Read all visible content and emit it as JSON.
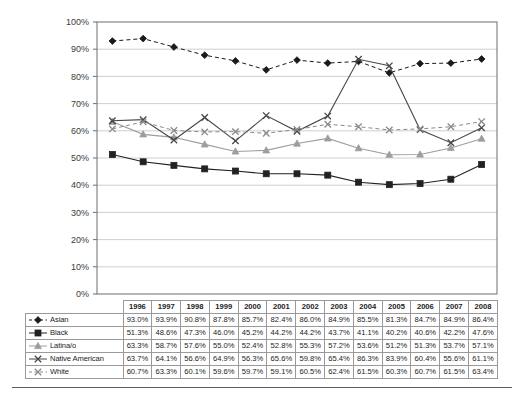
{
  "chart_data": {
    "type": "line",
    "title": "",
    "xlabel": "",
    "ylabel": "",
    "categories": [
      "1996",
      "1997",
      "1998",
      "1999",
      "2000",
      "2001",
      "2002",
      "2003",
      "2004",
      "2005",
      "2006",
      "2007",
      "2008"
    ],
    "ylim": [
      0,
      100
    ],
    "ytick_labels": [
      "0%",
      "10%",
      "20%",
      "30%",
      "40%",
      "50%",
      "60%",
      "70%",
      "80%",
      "90%",
      "100%"
    ],
    "ytick_values": [
      0,
      10,
      20,
      30,
      40,
      50,
      60,
      70,
      80,
      90,
      100
    ],
    "grid": "horizontal",
    "legend_position": "table-row-labels",
    "series": [
      {
        "name": "Asian",
        "marker": "diamond",
        "line_style": "dashed",
        "color": "#1a1a1a",
        "values": [
          93.0,
          93.9,
          90.8,
          87.8,
          85.7,
          82.4,
          86.0,
          84.9,
          85.5,
          81.3,
          84.7,
          84.9,
          86.4
        ],
        "labels": [
          "93.0%",
          "93.9%",
          "90.8%",
          "87.8%",
          "85.7%",
          "82.4%",
          "86.0%",
          "84.9%",
          "85.5%",
          "81.3%",
          "84.7%",
          "84.9%",
          "86.4%"
        ]
      },
      {
        "name": "Black",
        "marker": "square",
        "line_style": "solid",
        "color": "#222222",
        "values": [
          51.3,
          48.6,
          47.3,
          46.0,
          45.2,
          44.2,
          44.2,
          43.7,
          41.1,
          40.2,
          40.6,
          42.2,
          47.6
        ],
        "labels": [
          "51.3%",
          "48.6%",
          "47.3%",
          "46.0%",
          "45.2%",
          "44.2%",
          "44.2%",
          "43.7%",
          "41.1%",
          "40.2%",
          "40.6%",
          "42.2%",
          "47.6%"
        ]
      },
      {
        "name": "Latina/o",
        "marker": "triangle",
        "line_style": "solid",
        "color": "#9d9d9d",
        "values": [
          63.3,
          58.7,
          57.6,
          55.0,
          52.4,
          52.8,
          55.3,
          57.2,
          53.6,
          51.2,
          51.3,
          53.7,
          57.1
        ],
        "labels": [
          "63.3%",
          "58.7%",
          "57.6%",
          "55.0%",
          "52.4%",
          "52.8%",
          "55.3%",
          "57.2%",
          "53.6%",
          "51.2%",
          "51.3%",
          "53.7%",
          "57.1%"
        ]
      },
      {
        "name": "Native American",
        "marker": "cross",
        "line_style": "solid",
        "color": "#474747",
        "values": [
          63.7,
          64.1,
          56.6,
          64.9,
          56.3,
          65.6,
          59.8,
          65.4,
          86.3,
          83.9,
          60.4,
          55.6,
          61.1
        ],
        "labels": [
          "63.7%",
          "64.1%",
          "56.6%",
          "64.9%",
          "56.3%",
          "65.6%",
          "59.8%",
          "65.4%",
          "86.3%",
          "83.9%",
          "60.4%",
          "55.6%",
          "61.1%"
        ]
      },
      {
        "name": "White",
        "marker": "cross",
        "line_style": "dashed",
        "color": "#8a8a8a",
        "values": [
          60.7,
          63.3,
          60.1,
          59.6,
          59.7,
          59.1,
          60.5,
          62.4,
          61.5,
          60.3,
          60.7,
          61.5,
          63.4
        ],
        "labels": [
          "60.7%",
          "63.3%",
          "60.1%",
          "59.6%",
          "59.7%",
          "59.1%",
          "60.5%",
          "62.4%",
          "61.5%",
          "60.3%",
          "60.7%",
          "61.5%",
          "63.4%"
        ]
      }
    ]
  },
  "table": {
    "corner_label": "",
    "header_row": [
      "1996",
      "1997",
      "1998",
      "1999",
      "2000",
      "2001",
      "2002",
      "2003",
      "2004",
      "2005",
      "2006",
      "2007",
      "2008"
    ],
    "rows": [
      {
        "label": "Asian",
        "values": [
          "93.0%",
          "93.9%",
          "90.8%",
          "87.8%",
          "85.7%",
          "82.4%",
          "86.0%",
          "84.9%",
          "85.5%",
          "81.3%",
          "84.7%",
          "84.9%",
          "86.4%"
        ]
      },
      {
        "label": "Black",
        "values": [
          "51.3%",
          "48.6%",
          "47.3%",
          "46.0%",
          "45.2%",
          "44.2%",
          "44.2%",
          "43.7%",
          "41.1%",
          "40.2%",
          "40.6%",
          "42.2%",
          "47.6%"
        ]
      },
      {
        "label": "Latina/o",
        "values": [
          "63.3%",
          "58.7%",
          "57.6%",
          "55.0%",
          "52.4%",
          "52.8%",
          "55.3%",
          "57.2%",
          "53.6%",
          "51.2%",
          "51.3%",
          "53.7%",
          "57.1%"
        ]
      },
      {
        "label": "Native American",
        "values": [
          "63.7%",
          "64.1%",
          "56.6%",
          "64.9%",
          "56.3%",
          "65.6%",
          "59.8%",
          "65.4%",
          "86.3%",
          "83.9%",
          "60.4%",
          "55.6%",
          "61.1%"
        ]
      },
      {
        "label": "White",
        "values": [
          "60.7%",
          "63.3%",
          "60.1%",
          "59.6%",
          "59.7%",
          "59.1%",
          "60.5%",
          "62.4%",
          "61.5%",
          "60.3%",
          "60.7%",
          "61.5%",
          "63.4%"
        ]
      }
    ]
  },
  "colors": {
    "plot_frame": "#6e6e6e",
    "gridline": "#c4c4c4",
    "table_border": "#9a9a9a",
    "background": "#ffffff"
  }
}
